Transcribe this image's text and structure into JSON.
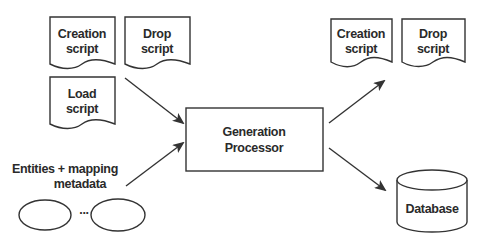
{
  "inputs": {
    "creation_script": {
      "line1": "Creation",
      "line2": "script"
    },
    "drop_script": {
      "line1": "Drop",
      "line2": "script"
    },
    "load_script": {
      "line1": "Load",
      "line2": "script"
    },
    "entities": {
      "line1": "Entities  + mapping",
      "line2": "metadata",
      "ellipsis": "..."
    }
  },
  "processor": {
    "line1": "Generation",
    "line2": "Processor"
  },
  "outputs": {
    "creation_script": {
      "line1": "Creation",
      "line2": "script"
    },
    "drop_script": {
      "line1": "Drop",
      "line2": "script"
    },
    "database": {
      "label": "Database"
    }
  },
  "colors": {
    "stroke": "#333333",
    "text": "#2a2a2a",
    "background": "#ffffff"
  }
}
